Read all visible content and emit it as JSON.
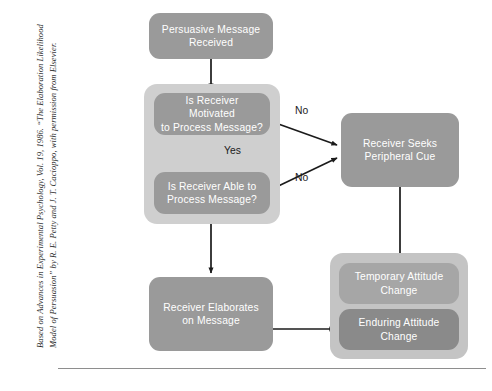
{
  "credit": {
    "text": "Based on Advances in Experimental Psychology, Vol. 19, 1986. “The Elaboration Likelihood Model of Persuasion” by R. E. Petty and J. T. Cacioppo, with permission from Elsevier."
  },
  "colors": {
    "node_fill": "#9a9a9a",
    "node_fill_dark": "#8a8a8a",
    "node_fill_light": "#a6a6a6",
    "panel_fill": "#cfcfcf",
    "panel_fill_outcome": "#c4c4c4",
    "node_text": "#ffffff",
    "connector": "#1b1b1b",
    "rule": "#8e8e8e",
    "credit_text": "#2a2a2a",
    "page_background": "#ffffff"
  },
  "diagram": {
    "type": "flowchart",
    "title": "Elaboration Likelihood Model of Persuasion",
    "nodes": [
      {
        "id": "persuasive-message",
        "label": "Persuasive Message\nReceived",
        "shape": "rounded-rect",
        "style": "node",
        "x": 101,
        "y": 13,
        "w": 124,
        "h": 46
      },
      {
        "id": "is-motivated",
        "label": "Is Receiver Motivated\nto Process Message?",
        "shape": "rounded-rect",
        "style": "node",
        "x": 106,
        "y": 93,
        "w": 116,
        "h": 42
      },
      {
        "id": "is-able",
        "label": "Is Receiver Able to\nProcess Message?",
        "shape": "rounded-rect",
        "style": "node",
        "x": 106,
        "y": 172,
        "w": 116,
        "h": 42
      },
      {
        "id": "peripheral-cue",
        "label": "Receiver Seeks\nPeripheral Cue",
        "shape": "rounded-rect",
        "style": "node",
        "x": 293,
        "y": 113,
        "w": 118,
        "h": 74
      },
      {
        "id": "elaborates",
        "label": "Receiver Elaborates\non Message",
        "shape": "rounded-rect",
        "style": "node",
        "x": 101,
        "y": 277,
        "w": 124,
        "h": 74
      },
      {
        "id": "temporary-change",
        "label": "Temporary Attitude\nChange",
        "shape": "rounded-rect",
        "style": "node-light",
        "x": 291,
        "y": 263,
        "w": 120,
        "h": 41
      },
      {
        "id": "enduring-change",
        "label": "Enduring Attitude\nChange",
        "shape": "rounded-rect",
        "style": "node-dark",
        "x": 291,
        "y": 309,
        "w": 120,
        "h": 41
      }
    ],
    "panels": [
      {
        "id": "processing-panel",
        "x": 96,
        "y": 84,
        "w": 136,
        "h": 140
      },
      {
        "id": "outcome-panel",
        "x": 282,
        "y": 253,
        "w": 138,
        "h": 106
      }
    ],
    "edges": [
      {
        "id": "message-to-motivated",
        "from": "persuasive-message",
        "to": "is-motivated",
        "label": "",
        "kind": "arrow"
      },
      {
        "id": "motivated-to-able",
        "from": "is-motivated",
        "to": "is-able",
        "label": "Yes",
        "kind": "arrow"
      },
      {
        "id": "motivated-to-peripheral",
        "from": "is-motivated",
        "to": "peripheral-cue",
        "label": "No",
        "kind": "arrow"
      },
      {
        "id": "able-to-peripheral",
        "from": "is-able",
        "to": "peripheral-cue",
        "label": "No",
        "kind": "arrow"
      },
      {
        "id": "able-to-elaborates",
        "from": "is-able",
        "to": "elaborates",
        "label": "",
        "kind": "arrow"
      },
      {
        "id": "peripheral-to-temporary",
        "from": "peripheral-cue",
        "to": "temporary-change",
        "label": "",
        "kind": "arrow"
      },
      {
        "id": "elaborates-to-enduring",
        "from": "elaborates",
        "to": "enduring-change",
        "label": "",
        "kind": "arrow"
      }
    ],
    "edge_labels": [
      {
        "id": "label-yes",
        "text": "Yes",
        "x": 176,
        "y": 145
      },
      {
        "id": "label-no-motivated",
        "text": "No",
        "x": 247,
        "y": 105
      },
      {
        "id": "label-no-able",
        "text": "No",
        "x": 247,
        "y": 172
      }
    ]
  }
}
